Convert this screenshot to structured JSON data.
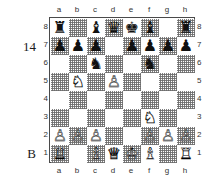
{
  "diagram": {
    "move_number": "14",
    "side_to_move": "B",
    "file_labels": [
      "a",
      "b",
      "c",
      "d",
      "e",
      "f",
      "g",
      "h"
    ],
    "rank_labels": [
      "8",
      "7",
      "6",
      "5",
      "4",
      "3",
      "2",
      "1"
    ],
    "light_square_color": "#ffffff",
    "dark_square_color": "#c8c8c8",
    "border_color": "#4a4a4a",
    "piece_glyphs": {
      "wK": "♔",
      "wQ": "♕",
      "wR": "♖",
      "wB": "♗",
      "wN": "♘",
      "wP": "♙",
      "bK": "♚",
      "bQ": "♛",
      "bR": "♜",
      "bB": "♝",
      "bN": "♞",
      "bP": "♟"
    },
    "board": [
      [
        "bR",
        "",
        "bB",
        "bQ",
        "bK",
        "bB",
        "",
        "bR"
      ],
      [
        "bP",
        "bP",
        "bP",
        "",
        "bP",
        "bP",
        "bP",
        "bP"
      ],
      [
        "",
        "",
        "bN",
        "",
        "",
        "bN",
        "",
        ""
      ],
      [
        "",
        "wN",
        "",
        "wP",
        "",
        "",
        "",
        ""
      ],
      [
        "",
        "",
        "",
        "",
        "",
        "",
        "",
        ""
      ],
      [
        "",
        "",
        "",
        "",
        "",
        "wN",
        "",
        ""
      ],
      [
        "wP",
        "wP",
        "wP",
        "",
        "",
        "wP",
        "wP",
        "wP"
      ],
      [
        "wR",
        "",
        "wB",
        "wQ",
        "wK",
        "wB",
        "",
        "wR"
      ]
    ]
  }
}
